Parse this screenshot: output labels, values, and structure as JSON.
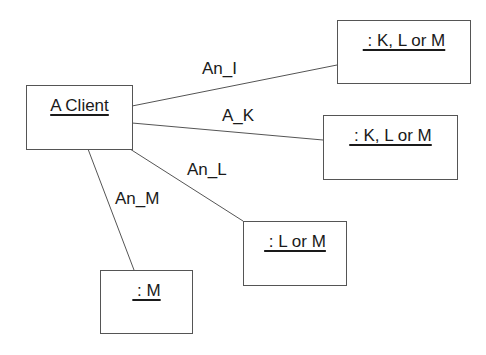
{
  "diagram": {
    "type": "UML object/collaboration diagram",
    "objects": [
      {
        "id": "client",
        "name": "A Client"
      },
      {
        "id": "obj1",
        "name": " : K, L or M"
      },
      {
        "id": "obj2",
        "name": " : K, L or M"
      },
      {
        "id": "obj3",
        "name": " : L or M"
      },
      {
        "id": "obj4",
        "name": " : M"
      }
    ],
    "links": [
      {
        "from": "client",
        "to": "obj1",
        "label": "An_I"
      },
      {
        "from": "client",
        "to": "obj2",
        "label": "A_K"
      },
      {
        "from": "client",
        "to": "obj3",
        "label": "An_L"
      },
      {
        "from": "client",
        "to": "obj4",
        "label": "An_M"
      }
    ],
    "colors": {
      "line": "#555555",
      "text": "#1a1a1a",
      "background": "#ffffff"
    }
  }
}
